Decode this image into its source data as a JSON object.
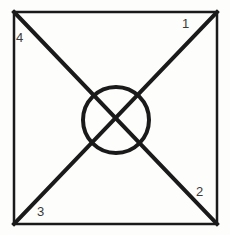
{
  "figure": {
    "title": "",
    "background_color": "#fdfdfc",
    "stroke_color": "#1a1a1a",
    "label_color": "#3a3a3a",
    "labels": [
      {
        "id": "label-1",
        "text": "1",
        "position": "top-right"
      },
      {
        "id": "label-2",
        "text": "2",
        "position": "bottom-right"
      },
      {
        "id": "label-3",
        "text": "3",
        "position": "bottom-left"
      },
      {
        "id": "label-4",
        "text": "4",
        "position": "top-left"
      }
    ],
    "shapes": {
      "square": {
        "name": "square-frame",
        "x": 14,
        "y": 12,
        "width": 203,
        "height": 212,
        "stroke_width": 2.5
      },
      "diagonal_tl_br": {
        "name": "diagonal-top-left-to-bottom-right",
        "x1": 14,
        "y1": 12,
        "x2": 217,
        "y2": 224,
        "stroke_width": 4
      },
      "diagonal_tr_bl": {
        "name": "diagonal-top-right-to-bottom-left",
        "x1": 217,
        "y1": 12,
        "x2": 14,
        "y2": 224,
        "stroke_width": 4
      },
      "circle": {
        "name": "center-circle",
        "cx": 116,
        "cy": 120,
        "r": 33,
        "stroke_width": 4
      }
    }
  }
}
